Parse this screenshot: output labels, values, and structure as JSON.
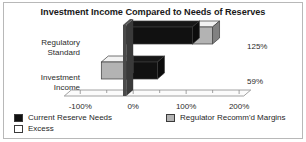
{
  "chart_data": {
    "type": "bar",
    "orientation": "horizontal",
    "stacked": true,
    "style": "3d",
    "title": "Investment Income Compared to Needs of Reserves",
    "xlabel": "",
    "ylabel": "",
    "categories": [
      "Regulatory Standard",
      "Investment Income"
    ],
    "category_lines": [
      [
        "Regulatory",
        "Standard"
      ],
      [
        "Investment",
        "Income"
      ]
    ],
    "value_labels": [
      "125%",
      "59%"
    ],
    "values": [
      125,
      59
    ],
    "series": [
      {
        "name": "Current Reserve Needs",
        "color": "#111111",
        "values": [
          125,
          59
        ]
      },
      {
        "name": "Regulator Recomm'd Margins",
        "color": "#b3b3b3",
        "values": [
          38,
          -47
        ]
      },
      {
        "name": "Excess",
        "color": "#ffffff",
        "values": [
          0,
          0
        ]
      }
    ],
    "segments": [
      {
        "category": "Regulatory Standard",
        "parts": [
          {
            "series": "Current Reserve Needs",
            "from": 0,
            "to": 125,
            "color": "#111111"
          },
          {
            "series": "Regulator Recomm'd Margins",
            "from": 125,
            "to": 163,
            "color": "#b3b3b3"
          }
        ]
      },
      {
        "category": "Investment Income",
        "parts": [
          {
            "series": "Regulator Recomm'd Margins",
            "from": -47,
            "to": 0,
            "color": "#b3b3b3"
          },
          {
            "series": "Current Reserve Needs",
            "from": 0,
            "to": 59,
            "color": "#111111"
          }
        ]
      }
    ],
    "xlim": [
      -125,
      230
    ],
    "xticks": [
      -100,
      0,
      100,
      200
    ],
    "xticklabels": [
      "-100%",
      "0%",
      "100%",
      "200%"
    ],
    "xminorticks": [
      -50,
      50,
      150
    ],
    "grid": false,
    "legend_position": "bottom",
    "legend": [
      {
        "label": "Current Reserve Needs",
        "color": "#111111"
      },
      {
        "label": "Excess",
        "color": "#ffffff"
      },
      {
        "label": "Regulator Recomm'd Margins",
        "color": "#b3b3b3"
      }
    ],
    "colors": {
      "current_reserve_needs": "#111111",
      "excess": "#ffffff",
      "regulator_margins": "#b3b3b3",
      "zero_wall": "#4a4a4a",
      "axis_line": "#8c8c8c",
      "border": "#b8b8b8",
      "text": "#1f1f1f",
      "background": "#ffffff"
    }
  }
}
